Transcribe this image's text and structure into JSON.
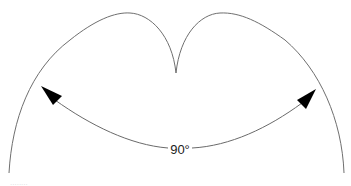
{
  "diagram": {
    "type": "polar radiation pattern (cardioid-like lobes with center null)",
    "beamwidth_label": "90°",
    "beamwidth_degrees": 90,
    "colors": {
      "pattern_line": "#6f6f6f",
      "arrow_line": "#6a6a6a",
      "arrowhead": "#000000",
      "text": "#222222"
    },
    "footer_text": "........"
  }
}
